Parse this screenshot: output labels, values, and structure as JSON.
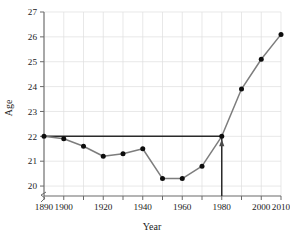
{
  "chart_data": {
    "type": "line",
    "title": "",
    "xlabel": "Year",
    "ylabel": "Age",
    "x": [
      1890,
      1900,
      1910,
      1920,
      1930,
      1940,
      1950,
      1960,
      1970,
      1980,
      1990,
      2000,
      2010
    ],
    "values": [
      22.0,
      21.9,
      21.6,
      21.2,
      21.3,
      21.5,
      20.3,
      20.3,
      20.8,
      22.0,
      23.9,
      25.1,
      26.1
    ],
    "xlim": [
      1890,
      2010
    ],
    "ylim": [
      19.6,
      27
    ],
    "xticks": [
      1890,
      1900,
      1910,
      1920,
      1930,
      1940,
      1950,
      1960,
      1970,
      1980,
      1990,
      2000,
      2010
    ],
    "xtick_labels": [
      "1890",
      "1900",
      "",
      "1920",
      "",
      "1940",
      "",
      "1960",
      "",
      "1980",
      "",
      "2000",
      "2010"
    ],
    "yticks": [
      20,
      21,
      22,
      23,
      24,
      25,
      26,
      27
    ],
    "ytick_labels": [
      "20",
      "21",
      "22",
      "23",
      "24",
      "25",
      "26",
      "27"
    ],
    "grid": true,
    "legend": "none",
    "y_axis_break": true,
    "annotations": [
      {
        "name": "reference-line-horizontal",
        "type": "hline",
        "y": 22.0,
        "x_start": 1890,
        "x_end": 1980,
        "label": ""
      },
      {
        "name": "reference-line-vertical",
        "type": "vline-arrow",
        "x": 1980,
        "y_start": 19.6,
        "y_end": 22.0,
        "label": ""
      }
    ]
  },
  "axes": {
    "y_title": "Age",
    "x_title": "Year"
  },
  "colors": {
    "data_line": "#7d7d7d",
    "data_point": "#0d0d0d",
    "reference_line": "#2b2b2b",
    "gridline": "#dedede",
    "axis": "#6a6a6a",
    "background": "#ffffff"
  }
}
